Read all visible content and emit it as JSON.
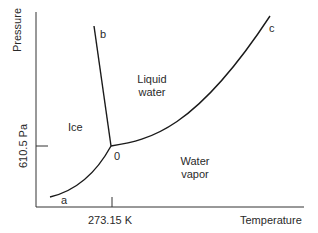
{
  "diagram": {
    "type": "phase_diagram",
    "subject": "water",
    "axes": {
      "x": {
        "label": "Temperature",
        "tick_label": "273.15 K"
      },
      "y": {
        "label": "Pressure",
        "tick_label": "610.5 Pa"
      }
    },
    "regions": {
      "ice": "Ice",
      "liquid_line1": "Liquid",
      "liquid_line2": "water",
      "vapor_line1": "Water",
      "vapor_line2": "vapor"
    },
    "points": {
      "triple_point": "0",
      "a": "a",
      "b": "b",
      "c": "c"
    },
    "colors": {
      "line": "#1a1a1a",
      "background": "#ffffff"
    }
  }
}
